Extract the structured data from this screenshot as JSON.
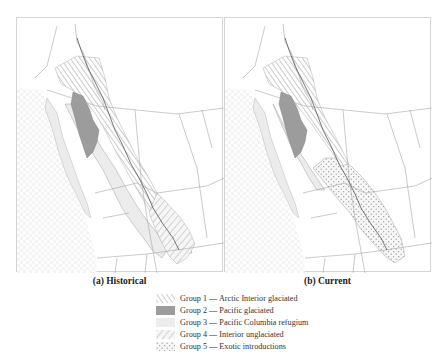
{
  "figure": {
    "panels": [
      {
        "id": "a",
        "caption": "(a) Historical"
      },
      {
        "id": "b",
        "caption": "(b) Current"
      }
    ],
    "legend": [
      {
        "group": "Group 1",
        "label": "Group 1 — Arctic Interior glaciated",
        "pattern": "diagonal-hatch-right",
        "color": "#9a9a9a"
      },
      {
        "group": "Group 2",
        "label": "Group 2 — Pacific glaciated",
        "pattern": "solid-fill",
        "color": "#9c9c9c"
      },
      {
        "group": "Group 3",
        "label": "Group 3 — Pacific Columbia refugium",
        "pattern": "light-fill",
        "color": "#ececec"
      },
      {
        "group": "Group 4",
        "label": "Group 4 — Interior unglaciated",
        "pattern": "diagonal-hatch-left",
        "color": "#b0b0b0"
      },
      {
        "group": "Group 5",
        "label": "Group 5 — Exotic introductions",
        "pattern": "stipple-dots",
        "color": "#9a9a9a"
      }
    ],
    "colors": {
      "border": "#8a8a8a",
      "frame": "#d4d4d4",
      "ocean_texture": "#f1f1f1",
      "group2_fill": "#9c9c9c",
      "group3_fill": "#ececec"
    }
  }
}
